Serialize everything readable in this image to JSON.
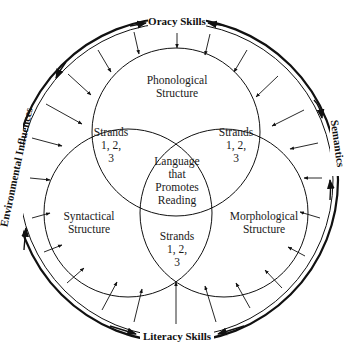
{
  "diagram": {
    "outer_ring": {
      "top_label": "Oracy Skills",
      "bottom_label": "Literacy Skills",
      "left_label": "Environmental Influences",
      "right_label": "Semantics"
    },
    "circles": {
      "top": {
        "line1": "Phonological",
        "line2": "Structure"
      },
      "left": {
        "line1": "Syntactical",
        "line2": "Structure"
      },
      "right": {
        "line1": "Morphological",
        "line2": "Structure"
      }
    },
    "overlaps": {
      "top_left": {
        "line1": "Strands",
        "line2": "1,  2,",
        "line3": "3"
      },
      "top_right": {
        "line1": "Strands",
        "line2": "1,  2,",
        "line3": "3"
      },
      "bottom": {
        "line1": "Strands",
        "line2": "1,  2,",
        "line3": "3"
      }
    },
    "center": {
      "line1": "Language",
      "line2": "that",
      "line3": "Promotes",
      "line4": "Reading"
    },
    "colors": {
      "ink": "#111111",
      "background": "#ffffff"
    }
  }
}
